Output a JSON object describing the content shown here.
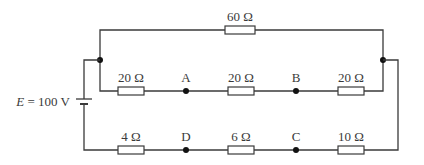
{
  "circuit": {
    "source": {
      "label_var": "E",
      "label_eq": " = 100 V"
    },
    "top_branch": {
      "resistor": "60 Ω"
    },
    "middle_branch": {
      "resistors": [
        "20 Ω",
        "20 Ω",
        "20 Ω"
      ],
      "nodes": [
        "A",
        "B"
      ]
    },
    "bottom_branch": {
      "resistors": [
        "4 Ω",
        "6 Ω",
        "10 Ω"
      ],
      "nodes": [
        "D",
        "C"
      ]
    }
  }
}
